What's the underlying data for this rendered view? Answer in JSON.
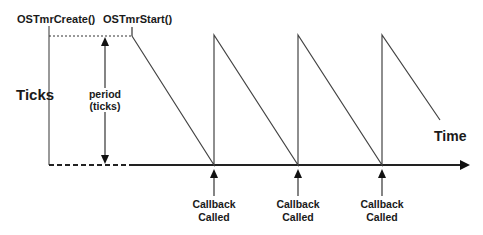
{
  "diagram": {
    "labels": {
      "create_call": "OSTmrCreate()",
      "start_call": "OSTmrStart()",
      "y_axis": "Ticks",
      "x_axis": "Time",
      "period_line1": "period",
      "period_line2": "(ticks)"
    },
    "callbacks": [
      {
        "line1": "Callback",
        "line2": "Called"
      },
      {
        "line1": "Callback",
        "line2": "Called"
      },
      {
        "line1": "Callback",
        "line2": "Called"
      }
    ],
    "colors": {
      "line": "#333333",
      "text": "#1a1a1a",
      "background": "#ffffff"
    }
  }
}
